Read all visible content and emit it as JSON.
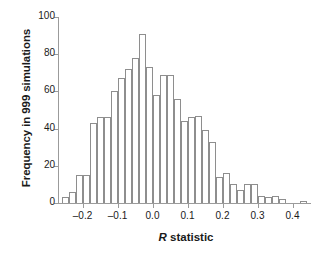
{
  "chart_data": {
    "type": "bar",
    "title": "",
    "subtitle": "",
    "xlabel": "R statistic",
    "xlabel_italic_part": "R",
    "xlabel_rest": " statistic",
    "ylabel": "Frequency in 999 simulations",
    "xlim": [
      -0.27,
      0.45
    ],
    "ylim": [
      0,
      100
    ],
    "grid": false,
    "legend": null,
    "bin_width": 0.02,
    "xticks": [
      -0.2,
      -0.1,
      0.0,
      0.1,
      0.2,
      0.3,
      0.4
    ],
    "xtick_labels": [
      "–0.2",
      "–0.1",
      "0.0",
      "0.1",
      "0.2",
      "0.3",
      "0.4"
    ],
    "yticks": [
      0,
      20,
      40,
      60,
      80,
      100
    ],
    "ytick_labels": [
      "0",
      "20",
      "40",
      "60",
      "80",
      "100"
    ],
    "bin_edges": [
      -0.26,
      -0.24,
      -0.22,
      -0.2,
      -0.18,
      -0.16,
      -0.14,
      -0.12,
      -0.1,
      -0.08,
      -0.06,
      -0.04,
      -0.02,
      0.0,
      0.02,
      0.04,
      0.06,
      0.08,
      0.1,
      0.12,
      0.14,
      0.16,
      0.18,
      0.2,
      0.22,
      0.24,
      0.26,
      0.28,
      0.3,
      0.32,
      0.34,
      0.36,
      0.38,
      0.4,
      0.42,
      0.44
    ],
    "categories": [
      "-0.26",
      "-0.24",
      "-0.22",
      "-0.20",
      "-0.18",
      "-0.16",
      "-0.14",
      "-0.12",
      "-0.10",
      "-0.08",
      "-0.06",
      "-0.04",
      "-0.02",
      "0.00",
      "0.02",
      "0.04",
      "0.06",
      "0.08",
      "0.10",
      "0.12",
      "0.14",
      "0.16",
      "0.18",
      "0.20",
      "0.22",
      "0.24",
      "0.26",
      "0.28",
      "0.30",
      "0.32",
      "0.34",
      "0.36",
      "0.38",
      "0.40",
      "0.42"
    ],
    "values": [
      3,
      6,
      15,
      15,
      43,
      46,
      46,
      60,
      67,
      72,
      78,
      91,
      73,
      58,
      69,
      69,
      56,
      44,
      46,
      47,
      39,
      33,
      14,
      16,
      10,
      7,
      10,
      10,
      4,
      3,
      4,
      2,
      0,
      0,
      1
    ],
    "colors": {
      "bar_fill": "#ffffff",
      "bar_edge": "#8e8e8e",
      "axis": "#9b9b9b",
      "text": "#1a1a1a",
      "background": "#ffffff"
    }
  }
}
